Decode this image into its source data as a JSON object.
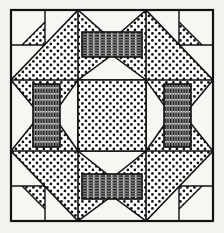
{
  "figure": {
    "kind": "line-drawing",
    "caption": "",
    "canvas": {
      "width": 224,
      "height": 233,
      "background": "#f4f2ee"
    },
    "border": {
      "x": 11,
      "y": 10,
      "width": 202,
      "height": 211,
      "stroke": "#111111",
      "stroke_width": 2.2,
      "fill": "#f7f6f2"
    },
    "grid": {
      "rows": 3,
      "cols": 3,
      "x_lines": [
        11,
        78,
        146,
        213
      ],
      "y_lines": [
        10,
        80,
        151,
        221
      ],
      "stroke": "#111111",
      "stroke_width": 1.6
    },
    "fills": {
      "dotted": {
        "name": "dotted",
        "dot_color": "#111111",
        "background": "#ffffff",
        "dot_radius": 1.35,
        "spacing": 7
      },
      "horizontal_stripe": {
        "name": "horizontal-stripe",
        "line_color": "#1b1b1b",
        "background": "#8d8d8d",
        "spacing": 2.6
      },
      "vertical_stripe": {
        "name": "vertical-stripe",
        "line_color": "#1b1b1b",
        "background": "#8d8d8d",
        "spacing": 2.6
      },
      "blank": {
        "name": "blank",
        "background": "#f7f6f2"
      }
    },
    "blocks": [
      {
        "id": "top-left",
        "row": 0,
        "col": 0,
        "type": "corner",
        "orientation": "nw",
        "fill": "dotted"
      },
      {
        "id": "top-center",
        "row": 0,
        "col": 1,
        "type": "bar-horizontal",
        "orientation": "n",
        "fill": "dotted",
        "bar_fill": "horizontal_stripe"
      },
      {
        "id": "top-right",
        "row": 0,
        "col": 2,
        "type": "corner",
        "orientation": "ne",
        "fill": "dotted"
      },
      {
        "id": "middle-left",
        "row": 1,
        "col": 0,
        "type": "bar-vertical",
        "orientation": "w",
        "fill": "dotted",
        "bar_fill": "vertical_stripe"
      },
      {
        "id": "center",
        "row": 1,
        "col": 1,
        "type": "solid",
        "orientation": "c",
        "fill": "dotted"
      },
      {
        "id": "middle-right",
        "row": 1,
        "col": 2,
        "type": "bar-vertical",
        "orientation": "e",
        "fill": "dotted",
        "bar_fill": "vertical_stripe"
      },
      {
        "id": "bottom-left",
        "row": 2,
        "col": 0,
        "type": "corner",
        "orientation": "sw",
        "fill": "dotted"
      },
      {
        "id": "bottom-center",
        "row": 2,
        "col": 1,
        "type": "bar-horizontal",
        "orientation": "s",
        "fill": "dotted",
        "bar_fill": "horizontal_stripe"
      },
      {
        "id": "bottom-right",
        "row": 2,
        "col": 2,
        "type": "corner",
        "orientation": "se",
        "fill": "dotted"
      }
    ]
  }
}
